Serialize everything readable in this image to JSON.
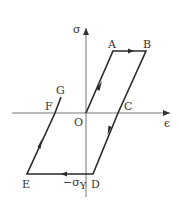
{
  "diagram": {
    "type": "stress-strain hysteresis loop (elastic-perfectly plastic)",
    "axes": {
      "y_label": "σ",
      "x_label": "ϵ",
      "origin_label": "O"
    },
    "points": {
      "A": "A",
      "B": "B",
      "C": "C",
      "D": "D",
      "E": "E",
      "F": "F",
      "G": "G"
    },
    "annotations": {
      "neg_yield": "−σ",
      "neg_yield_subscript": "Y"
    },
    "path_order": [
      "O",
      "A",
      "B",
      "C",
      "D",
      "E",
      "F",
      "G"
    ],
    "colors": {
      "curve": "#2a2a2a",
      "axis": "#777777",
      "text": "#333333"
    }
  }
}
